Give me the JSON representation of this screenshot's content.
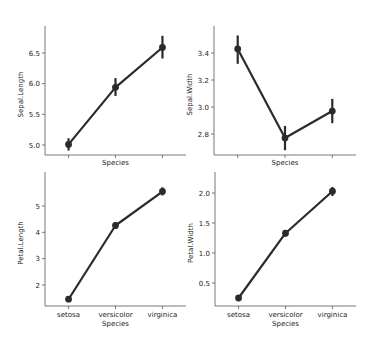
{
  "chart_data": [
    {
      "type": "line",
      "panel": "top-left",
      "title": "",
      "xlabel": "Species",
      "ylabel": "Sepal.Length",
      "categories": [
        "setosa",
        "versicolor",
        "virginica"
      ],
      "show_xticklabels": false,
      "values": [
        5.01,
        5.94,
        6.59
      ],
      "ci_low": [
        4.91,
        5.8,
        6.41
      ],
      "ci_high": [
        5.11,
        6.09,
        6.78
      ],
      "yticks": [
        5.0,
        5.5,
        6.0,
        6.5
      ],
      "yticklabels": [
        "5.0",
        "5.5",
        "6.0",
        "6.5"
      ],
      "ylim": [
        4.82,
        6.95
      ],
      "grid": false,
      "box": {
        "x0": 45,
        "x1": 186,
        "y0": 26,
        "y1": 155
      },
      "tick_px": [
        [
          5.0,
          145
        ],
        [
          6.5,
          53
        ]
      ]
    },
    {
      "type": "line",
      "panel": "top-right",
      "title": "",
      "xlabel": "Species",
      "ylabel": "Sepal.Width",
      "categories": [
        "setosa",
        "versicolor",
        "virginica"
      ],
      "show_xticklabels": false,
      "values": [
        3.43,
        2.77,
        2.97
      ],
      "ci_low": [
        3.32,
        2.68,
        2.88
      ],
      "ci_high": [
        3.53,
        2.86,
        3.06
      ],
      "yticks": [
        2.8,
        3.0,
        3.2,
        3.4
      ],
      "yticklabels": [
        "2.8",
        "3.0",
        "3.2",
        "3.4"
      ],
      "ylim": [
        2.65,
        3.58
      ],
      "grid": false,
      "box": {
        "x0": 214,
        "x1": 356,
        "y0": 26,
        "y1": 155
      },
      "tick_px": [
        [
          2.8,
          134
        ],
        [
          3.4,
          53
        ]
      ]
    },
    {
      "type": "line",
      "panel": "bottom-left",
      "title": "",
      "xlabel": "Species",
      "ylabel": "Petal.Length",
      "categories": [
        "setosa",
        "versicolor",
        "virginica"
      ],
      "show_xticklabels": true,
      "values": [
        1.46,
        4.26,
        5.55
      ],
      "ci_low": [
        1.42,
        4.13,
        5.4
      ],
      "ci_high": [
        1.51,
        4.39,
        5.71
      ],
      "yticks": [
        2,
        3,
        4,
        5
      ],
      "yticklabels": [
        "2",
        "3",
        "4",
        "5"
      ],
      "ylim": [
        1.2,
        6.3
      ],
      "grid": false,
      "box": {
        "x0": 45,
        "x1": 186,
        "y0": 172,
        "y1": 306
      },
      "tick_px": [
        [
          2,
          285
        ],
        [
          5,
          206
        ]
      ]
    },
    {
      "type": "line",
      "panel": "bottom-right",
      "title": "",
      "xlabel": "Species",
      "ylabel": "Petal.Width",
      "categories": [
        "setosa",
        "versicolor",
        "virginica"
      ],
      "show_xticklabels": true,
      "values": [
        0.25,
        1.33,
        2.03
      ],
      "ci_low": [
        0.22,
        1.27,
        1.95
      ],
      "ci_high": [
        0.27,
        1.38,
        2.1
      ],
      "yticks": [
        0.5,
        1.0,
        1.5,
        2.0
      ],
      "yticklabels": [
        "0.5",
        "1.0",
        "1.5",
        "2.0"
      ],
      "ylim": [
        0.1,
        2.32
      ],
      "grid": false,
      "box": {
        "x0": 215,
        "x1": 356,
        "y0": 172,
        "y1": 306
      },
      "tick_px": [
        [
          0.5,
          283
        ],
        [
          2.0,
          193
        ]
      ]
    }
  ],
  "style": {
    "line_color": "#2b2b2b",
    "spine_color": "#555555",
    "text_color": "#222222"
  }
}
